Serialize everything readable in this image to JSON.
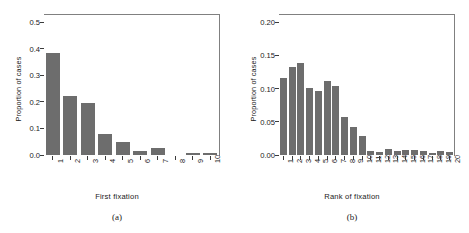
{
  "figure": {
    "background": "#ffffff",
    "bar_color": "#6d6d6d",
    "axis_color": "#3b3b3b",
    "box_color": "#808080"
  },
  "panels": [
    {
      "caption": "(a)",
      "chart_data": {
        "type": "bar",
        "title": "",
        "xlabel": "First fixation",
        "ylabel": "Proportion of cases",
        "categories": [
          "1",
          "2",
          "3",
          "4",
          "5",
          "6",
          "7",
          "8",
          "9",
          "10"
        ],
        "values": [
          0.384,
          0.223,
          0.197,
          0.08,
          0.048,
          0.014,
          0.027,
          0.0,
          0.007,
          0.008
        ],
        "ylim": [
          0.0,
          0.5
        ],
        "yticks": [
          0.0,
          0.1,
          0.2,
          0.3,
          0.4,
          0.5
        ],
        "ytick_labels": [
          "0.0",
          "0.1",
          "0.2",
          "0.3",
          "0.4",
          "0.5"
        ],
        "grid": false,
        "legend": "none"
      }
    },
    {
      "caption": "(b)",
      "chart_data": {
        "type": "bar",
        "title": "",
        "xlabel": "Rank of fixation",
        "ylabel": "Proportion of cases",
        "categories": [
          "1",
          "2",
          "3",
          "4",
          "5",
          "6",
          "7",
          "8",
          "9",
          "10",
          "11",
          "12",
          "13",
          "14",
          "15",
          "16",
          "17",
          "18",
          "19",
          "20"
        ],
        "values": [
          0.116,
          0.133,
          0.138,
          0.101,
          0.096,
          0.111,
          0.104,
          0.057,
          0.042,
          0.028,
          0.006,
          0.005,
          0.009,
          0.006,
          0.007,
          0.008,
          0.006,
          0.003,
          0.006,
          0.005
        ],
        "ylim": [
          0.0,
          0.2
        ],
        "yticks": [
          0.0,
          0.05,
          0.1,
          0.15,
          0.2
        ],
        "ytick_labels": [
          "0.00",
          "0.05",
          "0.10",
          "0.15",
          "0.20"
        ],
        "grid": false,
        "legend": "none"
      }
    }
  ]
}
